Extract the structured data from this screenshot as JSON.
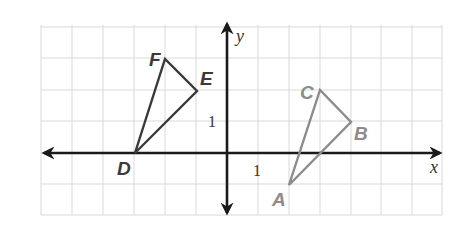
{
  "diagram": {
    "type": "coordinate-plane",
    "axes": {
      "x_label": "x",
      "y_label": "y",
      "x_tick_label": "1",
      "y_tick_label": "1",
      "x_range": [
        -6,
        7
      ],
      "y_range": [
        -2,
        4
      ]
    },
    "colors": {
      "grid": "#d9d9d9",
      "axis": "#1a1a1a",
      "triangle_def": "#3a3a3a",
      "triangle_abc": "#8c8c8c"
    },
    "triangles": [
      {
        "name": "DEF",
        "vertices": [
          {
            "label": "D",
            "x": -3,
            "y": 0
          },
          {
            "label": "E",
            "x": -1,
            "y": 2
          },
          {
            "label": "F",
            "x": -2,
            "y": 3
          }
        ]
      },
      {
        "name": "ABC",
        "vertices": [
          {
            "label": "A",
            "x": 2,
            "y": -1
          },
          {
            "label": "B",
            "x": 4,
            "y": 1
          },
          {
            "label": "C",
            "x": 3,
            "y": 2
          }
        ]
      }
    ],
    "labels": {
      "D": "D",
      "E": "E",
      "F": "F",
      "A": "A",
      "B": "B",
      "C": "C"
    }
  }
}
